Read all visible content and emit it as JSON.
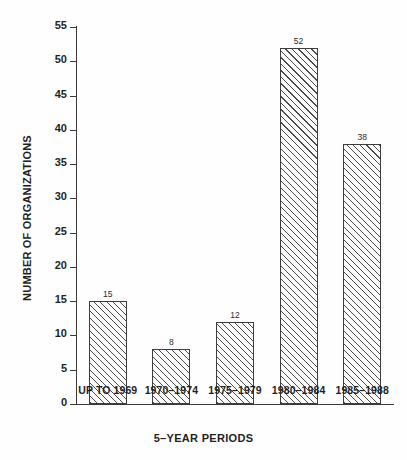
{
  "chart_data": {
    "type": "bar",
    "title": "",
    "xlabel": "5–YEAR PERIODS",
    "ylabel": "NUMBER OF ORGANIZATIONS",
    "categories": [
      "UP TO 1969",
      "1970–1974",
      "1975–1979",
      "1980–1984",
      "1985–1988"
    ],
    "values": [
      15,
      8,
      12,
      52,
      38
    ],
    "value_labels": [
      "15",
      "8",
      "12",
      "52",
      "38"
    ],
    "ylim": [
      0,
      55
    ],
    "ytick_step": 5,
    "yticks": [
      0,
      5,
      10,
      15,
      20,
      25,
      30,
      35,
      40,
      45,
      50,
      55
    ],
    "ytick_labels": [
      "0",
      "5",
      "10",
      "15",
      "20",
      "25",
      "30",
      "35",
      "40",
      "45",
      "50",
      "55"
    ],
    "grid": false,
    "legend": false,
    "legend_position": "none",
    "bar_fill": "diagonal-hatch",
    "colors": {
      "background": "#fefefe",
      "axis": "#3a3a3a",
      "text": "#1f1f1f",
      "bar_outline": "#3d3d3d",
      "bar_hatch": "#4a4a4a",
      "bar_face": "#fdfdfd"
    }
  }
}
